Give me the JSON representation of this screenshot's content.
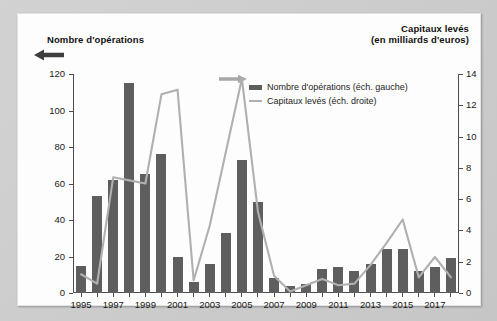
{
  "chart_data": {
    "type": "bar",
    "title": "",
    "ylabel": "Nombre d'opérations",
    "ylabel_right": "Capitaux levés (en milliards d'euros)",
    "ylabel_right_line1": "Capitaux levés",
    "ylabel_right_line2": "(en milliards d'euros)",
    "xlabel": "",
    "ylim": [
      0,
      120
    ],
    "ylim_right": [
      0,
      14
    ],
    "yticks": [
      0,
      20,
      40,
      60,
      80,
      100,
      120
    ],
    "yticks_right": [
      0,
      2,
      4,
      6,
      8,
      10,
      12,
      14
    ],
    "xticks": [
      "1995",
      "1997",
      "1999",
      "2001",
      "2003",
      "2005",
      "2007",
      "2009",
      "2011",
      "2013",
      "2015",
      "2017"
    ],
    "grid": false,
    "legend_position": "top-center",
    "categories": [
      "1995",
      "1996",
      "1997",
      "1998",
      "1999",
      "2000",
      "2001",
      "2002",
      "2003",
      "2004",
      "2005",
      "2006",
      "2007",
      "2008",
      "2009",
      "2010",
      "2011",
      "2012",
      "2013",
      "2014",
      "2015",
      "2016",
      "2017",
      "2018"
    ],
    "series": [
      {
        "name": "Nombre d'opérations (éch. gauche)",
        "axis": "left",
        "kind": "bar",
        "color": "#5e5e5e",
        "values": [
          15,
          53,
          62,
          115,
          65,
          76,
          20,
          6,
          16,
          33,
          73,
          50,
          8,
          4,
          5,
          13,
          14,
          12,
          16,
          24,
          24,
          12,
          14,
          19
        ]
      },
      {
        "name": "Capitaux levés (éch. droite)",
        "axis": "right",
        "kind": "line",
        "color": "#b0b0b0",
        "values": [
          1.2,
          0.6,
          7.4,
          7.2,
          7.0,
          12.7,
          13.0,
          0.8,
          4.3,
          9.0,
          13.7,
          5.2,
          1.1,
          0.1,
          0.5,
          0.9,
          0.5,
          0.6,
          1.8,
          3.2,
          4.7,
          1.0,
          2.3,
          1.0
        ]
      }
    ],
    "annotations": [
      {
        "name": "left-axis-arrow",
        "direction": "left",
        "color": "#3d3d3d"
      },
      {
        "name": "right-axis-arrow",
        "direction": "right",
        "color": "#a8a8a8"
      }
    ]
  },
  "colors": {
    "bar": "#5e5e5e",
    "line": "#b0b0b0",
    "axis": "#4d4d4d",
    "panel": "#fdfdfd",
    "frame": "#c9c9c9"
  }
}
